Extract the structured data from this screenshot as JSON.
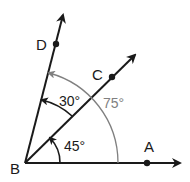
{
  "diagram": {
    "vertex": {
      "label": "B"
    },
    "rays": [
      {
        "label": "A",
        "angle_deg": 0
      },
      {
        "label": "C",
        "angle_deg": 45
      },
      {
        "label": "D",
        "angle_deg": 75
      }
    ],
    "angles": [
      {
        "name": "ABC",
        "label": "45°",
        "color": "#1a1a1a"
      },
      {
        "name": "CBD",
        "label": "30°",
        "color": "#1a1a1a"
      },
      {
        "name": "ABD",
        "label": "75°",
        "color": "#808080"
      }
    ],
    "colors": {
      "line": "#1a1a1a",
      "arc_gray": "#808080"
    }
  }
}
